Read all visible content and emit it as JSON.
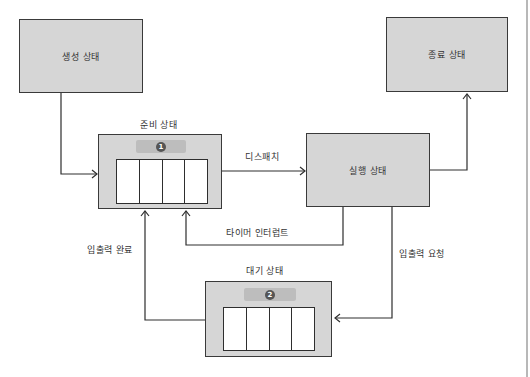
{
  "diagram": {
    "type": "process-state-transition",
    "states": {
      "new": {
        "label": "생성 상태"
      },
      "ready": {
        "label": "준비 상태",
        "badge": "1",
        "queue_slots": 4
      },
      "running": {
        "label": "실행 상태"
      },
      "terminated": {
        "label": "종료 상태"
      },
      "waiting": {
        "label": "대기 상태",
        "badge": "2",
        "queue_slots": 4
      }
    },
    "transitions": [
      {
        "from": "new",
        "to": "ready",
        "label": ""
      },
      {
        "from": "ready",
        "to": "running",
        "label": "디스패치"
      },
      {
        "from": "running",
        "to": "terminated",
        "label": ""
      },
      {
        "from": "running",
        "to": "ready",
        "label": "타이머 인터럽트"
      },
      {
        "from": "running",
        "to": "waiting",
        "label": "입출력 요청"
      },
      {
        "from": "waiting",
        "to": "ready",
        "label": "입출력 완료"
      }
    ],
    "colors": {
      "box_fill": "#d6d6d6",
      "badge_bar": "#bdbdbd",
      "badge": "#555555",
      "line": "#2e2e2e",
      "queue_fill": "#ffffff"
    }
  }
}
